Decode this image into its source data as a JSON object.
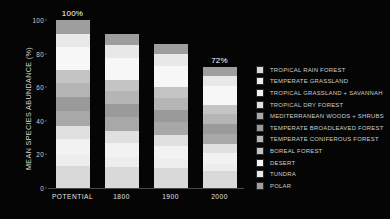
{
  "chart_data": {
    "type": "bar",
    "subtype": "stacked-bar",
    "title": "",
    "xlabel": "",
    "ylabel": "MEAN SPECIES ABUNDANCE (%)",
    "ylim": [
      0,
      100
    ],
    "yticks": [
      "0",
      "20",
      "40",
      "60",
      "80",
      "100"
    ],
    "grid": false,
    "legend_position": "right",
    "categories": [
      "POTENTIAL",
      "1800",
      "1900",
      "2000"
    ],
    "bar_totals": [
      100,
      92,
      86,
      72
    ],
    "bar_labels": [
      "100%",
      "",
      "",
      "72%"
    ],
    "series": [
      {
        "name": "TROPICAL RAIN FOREST",
        "color": "#d9d9d9",
        "values": [
          13.0,
          12.4,
          11.8,
          10.0
        ]
      },
      {
        "name": "TEMPERATE GRASSLAND",
        "color": "#ededed",
        "values": [
          6.5,
          5.9,
          5.4,
          4.2
        ]
      },
      {
        "name": "TROPICAL GRASSLAND + SAVANNAH",
        "color": "#f2f2f2",
        "values": [
          9.5,
          8.6,
          7.9,
          6.4
        ]
      },
      {
        "name": "TROPICAL DRY FOREST",
        "color": "#e0e0e0",
        "values": [
          8.0,
          7.2,
          6.6,
          5.4
        ]
      },
      {
        "name": "MEDITERRANEAN WOODS + SHRUBS",
        "color": "#a8a8a8",
        "values": [
          9.0,
          8.2,
          7.6,
          6.4
        ]
      },
      {
        "name": "TEMPERATE BROADLEAVED FOREST",
        "color": "#9a9a9a",
        "values": [
          8.5,
          7.8,
          7.2,
          6.0
        ]
      },
      {
        "name": "TEMPERATE CONIFEROUS FOREST",
        "color": "#b5b5b5",
        "values": [
          8.0,
          7.4,
          6.9,
          5.8
        ]
      },
      {
        "name": "BOREAL FOREST",
        "color": "#c4c4c4",
        "values": [
          7.5,
          6.9,
          6.5,
          5.5
        ]
      },
      {
        "name": "DESERT",
        "color": "#f7f7f7",
        "values": [
          14.0,
          13.2,
          12.6,
          11.0
        ]
      },
      {
        "name": "TUNDRA",
        "color": "#e8e8e8",
        "values": [
          8.0,
          7.6,
          7.2,
          6.3
        ]
      },
      {
        "name": "POLAR",
        "color": "#9e9e9e",
        "values": [
          8.0,
          6.8,
          6.3,
          5.0
        ]
      }
    ]
  },
  "axis": {
    "y_title": "MEAN SPECIES ABUNDANCE (%)",
    "ticks": [
      {
        "label": "100",
        "value": 100
      },
      {
        "label": "80",
        "value": 80
      },
      {
        "label": "60",
        "value": 60
      },
      {
        "label": "40",
        "value": 40
      },
      {
        "label": "20",
        "value": 20
      },
      {
        "label": "0",
        "value": 0
      }
    ]
  },
  "colors": {
    "background": "#050505",
    "axis": "#4a4a4a",
    "text": "#d8d8d8",
    "annotation": "#ffffff"
  }
}
